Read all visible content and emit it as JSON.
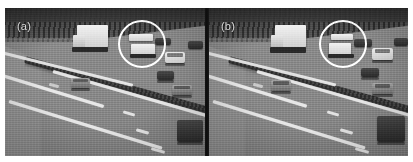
{
  "figure": {
    "type": "two-panel-comparison",
    "background_color": "#ffffff",
    "annotation_color": "#ffffff",
    "separator_color": "#121212"
  },
  "panels": [
    {
      "label": "(a)",
      "label_color": "#efefef",
      "scene": "motorway-traffic-frame",
      "highlight": {
        "shape": "circle",
        "target": "white-truck",
        "color": "#ffffff"
      },
      "vehicles": [
        {
          "name": "white-box-truck",
          "tone": "white"
        },
        {
          "name": "highlighted-white-truck",
          "tone": "white"
        },
        {
          "name": "dark-car-far-lane",
          "tone": "dark"
        },
        {
          "name": "silver-car-left-lane",
          "tone": "mid"
        },
        {
          "name": "white-van-right",
          "tone": "white"
        },
        {
          "name": "dark-car-right-lane",
          "tone": "dark"
        },
        {
          "name": "silver-car-right-lane",
          "tone": "mid"
        },
        {
          "name": "dark-vehicle-foreground",
          "tone": "dark"
        }
      ]
    },
    {
      "label": "(b)",
      "label_color": "#efefef",
      "scene": "motorway-traffic-frame",
      "highlight": {
        "shape": "circle",
        "target": "white-truck",
        "color": "#ffffff"
      },
      "vehicles": [
        {
          "name": "white-box-truck",
          "tone": "white"
        },
        {
          "name": "highlighted-white-truck",
          "tone": "white"
        },
        {
          "name": "dark-car-far-lane",
          "tone": "dark"
        },
        {
          "name": "silver-car-left-lane",
          "tone": "mid"
        },
        {
          "name": "white-van-right",
          "tone": "white"
        },
        {
          "name": "dark-car-right-lane",
          "tone": "dark"
        },
        {
          "name": "silver-car-right-lane",
          "tone": "mid"
        },
        {
          "name": "dark-vehicle-foreground",
          "tone": "dark"
        }
      ]
    }
  ]
}
